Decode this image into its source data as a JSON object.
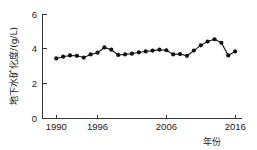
{
  "chart_data": {
    "type": "line",
    "title": "",
    "subtitle": "",
    "xlabel": "年份",
    "ylabel": "地下水矿化度/(g/L)",
    "xlim": [
      1988,
      2017
    ],
    "ylim": [
      0,
      6
    ],
    "yticks": [
      0,
      2,
      4,
      6
    ],
    "yticklabels": [
      "0",
      "2",
      "4",
      "6"
    ],
    "xticks": [
      1990,
      1996,
      2006,
      2016
    ],
    "xticklabels": [
      "1990",
      "1996",
      "2006",
      "2016"
    ],
    "grid": false,
    "legend": false,
    "marker": "filled-circle",
    "line_color": "#111111",
    "marker_color": "#111111",
    "x": [
      1990,
      1991,
      1992,
      1993,
      1994,
      1995,
      1996,
      1997,
      1998,
      1999,
      2000,
      2001,
      2002,
      2003,
      2004,
      2005,
      2006,
      2007,
      2008,
      2009,
      2010,
      2011,
      2012,
      2013,
      2014,
      2015,
      2016
    ],
    "values": [
      3.45,
      3.55,
      3.62,
      3.6,
      3.5,
      3.68,
      3.78,
      4.08,
      3.95,
      3.65,
      3.68,
      3.72,
      3.8,
      3.85,
      3.9,
      3.95,
      3.92,
      3.68,
      3.7,
      3.6,
      3.9,
      4.2,
      4.42,
      4.55,
      4.35,
      3.62,
      3.85
    ],
    "series": [
      {
        "name": "地下水矿化度",
        "values": [
          3.45,
          3.55,
          3.62,
          3.6,
          3.5,
          3.68,
          3.78,
          4.08,
          3.95,
          3.65,
          3.68,
          3.72,
          3.8,
          3.85,
          3.9,
          3.95,
          3.92,
          3.68,
          3.7,
          3.6,
          3.9,
          4.2,
          4.42,
          4.55,
          4.35,
          3.62,
          3.85
        ]
      }
    ]
  },
  "axes": {
    "y_tick_0": "0",
    "y_tick_1": "2",
    "y_tick_2": "4",
    "y_tick_3": "6",
    "x_tick_0": "1990",
    "x_tick_1": "1996",
    "x_tick_2": "2006",
    "x_tick_3": "2016",
    "y_axis_title": "地下水矿化度/(g/L)",
    "x_axis_title": "年份"
  }
}
